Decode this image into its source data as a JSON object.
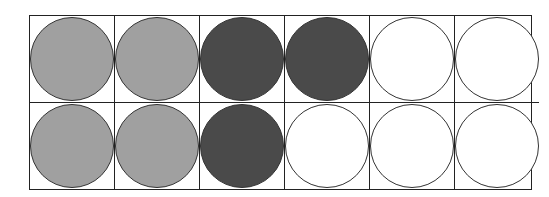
{
  "diagram": {
    "rows": 2,
    "columns": 6,
    "colors": {
      "light": "#a0a0a0",
      "dark": "#4a4a4a",
      "empty": "#ffffff"
    },
    "cells": [
      [
        "light",
        "light",
        "dark",
        "dark",
        "empty",
        "empty"
      ],
      [
        "light",
        "light",
        "dark",
        "empty",
        "empty",
        "empty"
      ]
    ],
    "counts": {
      "light": 4,
      "dark": 3,
      "empty": 5,
      "total": 12
    }
  }
}
